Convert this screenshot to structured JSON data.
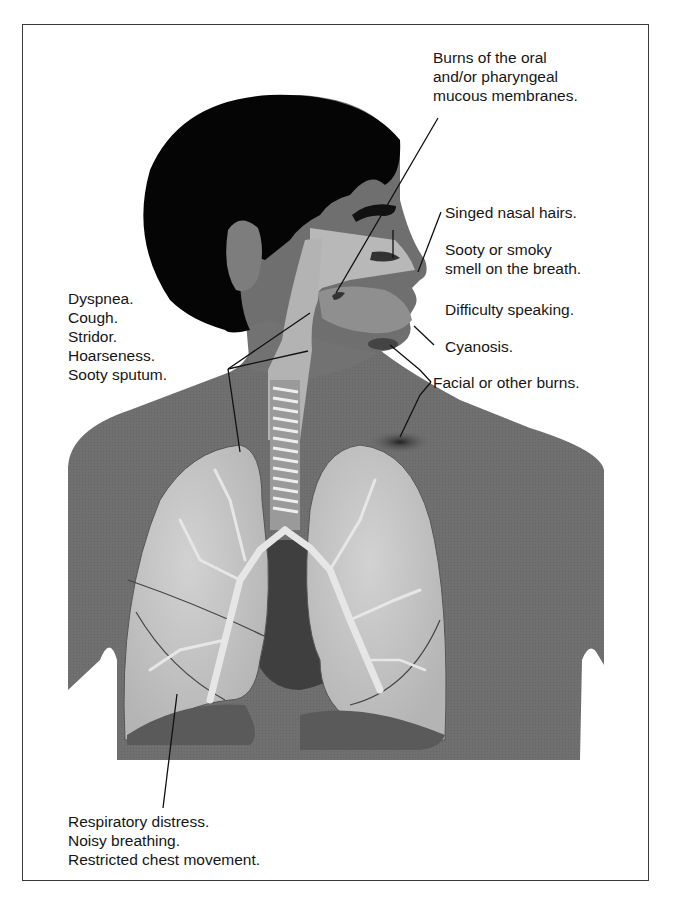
{
  "figure": {
    "colors": {
      "frame": "#3a3a3a",
      "hair": "#050505",
      "skin": "#6f6f6f",
      "skin_light": "#8a8a8a",
      "airway": "#b5b5b5",
      "lung": "#c4c4c4",
      "lung_base": "#5a5a5a",
      "heart": "#3f3f3f",
      "trachea_rings": "#eeeeee",
      "burn_mark": "#2e2e2e",
      "text": "#161616"
    }
  },
  "labels": {
    "burns_oral": [
      "Burns of the oral",
      "and/or pharyngeal",
      "mucous membranes."
    ],
    "singed_hairs": [
      "Singed nasal hairs."
    ],
    "sooty_smell": [
      "Sooty or smoky",
      "smell on the breath."
    ],
    "difficulty_speaking": [
      "Difficulty speaking."
    ],
    "cyanosis": [
      "Cyanosis."
    ],
    "facial_burns": [
      "Facial or other burns."
    ],
    "left_group": [
      "Dyspnea.",
      "Cough.",
      "Stridor.",
      "Hoarseness.",
      "Sooty sputum."
    ],
    "bottom_group": [
      "Respiratory distress.",
      "Noisy breathing.",
      "Restricted chest movement."
    ]
  }
}
